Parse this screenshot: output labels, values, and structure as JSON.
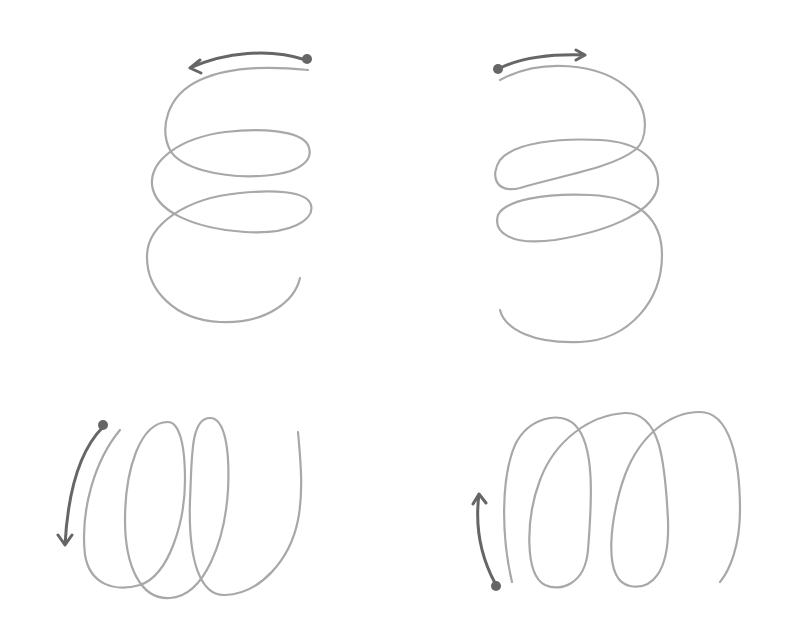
{
  "figure": {
    "colors": {
      "background": "#ffffff",
      "coil_stroke": "#a8a8a8",
      "arrow_stroke": "#666666"
    },
    "panels": [
      {
        "id": "top-left",
        "orientation": "vertical coil",
        "direction": "counter-clockwise, start top-right, arrow points left",
        "turns": 3
      },
      {
        "id": "top-right",
        "orientation": "vertical coil",
        "direction": "clockwise, start top-left, arrow points right",
        "turns": 3
      },
      {
        "id": "bottom-left",
        "orientation": "horizontal coil",
        "direction": "start top-left, arrow points down",
        "turns": 3
      },
      {
        "id": "bottom-right",
        "orientation": "horizontal coil",
        "direction": "start bottom-left, arrow points up",
        "turns": 3
      }
    ]
  }
}
